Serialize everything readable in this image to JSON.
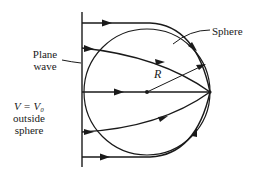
{
  "diagram": {
    "labels": {
      "sphere": "Sphere",
      "plane_wave_line1": "Plane",
      "plane_wave_line2": "wave",
      "radius": "R",
      "potential_line1": "V = V₀",
      "potential_line2": "outside",
      "potential_line3": "sphere"
    },
    "colors": {
      "stroke": "#1a1a1a",
      "background": "#ffffff"
    },
    "elements": {
      "plane_wavefront": "vertical line",
      "sphere_outline": "circle",
      "rays": [
        "top ray",
        "upper ray",
        "central axis ray",
        "lower ray",
        "bottom ray"
      ],
      "focal_point": "right edge of sphere on axis",
      "center_point": "sphere center"
    }
  }
}
